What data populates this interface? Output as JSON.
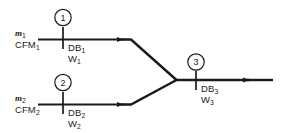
{
  "diagram": {
    "type": "process-flow",
    "stroke_color": "#1a1a1a",
    "background_color": "#ffffff",
    "streams": [
      {
        "id": "stream-1",
        "node_number": "1",
        "mass_flow_symbol": "m",
        "mass_flow_sub": "1",
        "volume_flow": "CFM",
        "volume_flow_sub": "1",
        "dry_bulb": "DB",
        "dry_bulb_sub": "1",
        "humidity_ratio": "W",
        "humidity_ratio_sub": "1"
      },
      {
        "id": "stream-2",
        "node_number": "2",
        "mass_flow_symbol": "m",
        "mass_flow_sub": "2",
        "volume_flow": "CFM",
        "volume_flow_sub": "2",
        "dry_bulb": "DB",
        "dry_bulb_sub": "2",
        "humidity_ratio": "W",
        "humidity_ratio_sub": "2"
      },
      {
        "id": "stream-3",
        "node_number": "3",
        "dry_bulb": "DB",
        "dry_bulb_sub": "3",
        "humidity_ratio": "W",
        "humidity_ratio_sub": "3"
      }
    ]
  }
}
